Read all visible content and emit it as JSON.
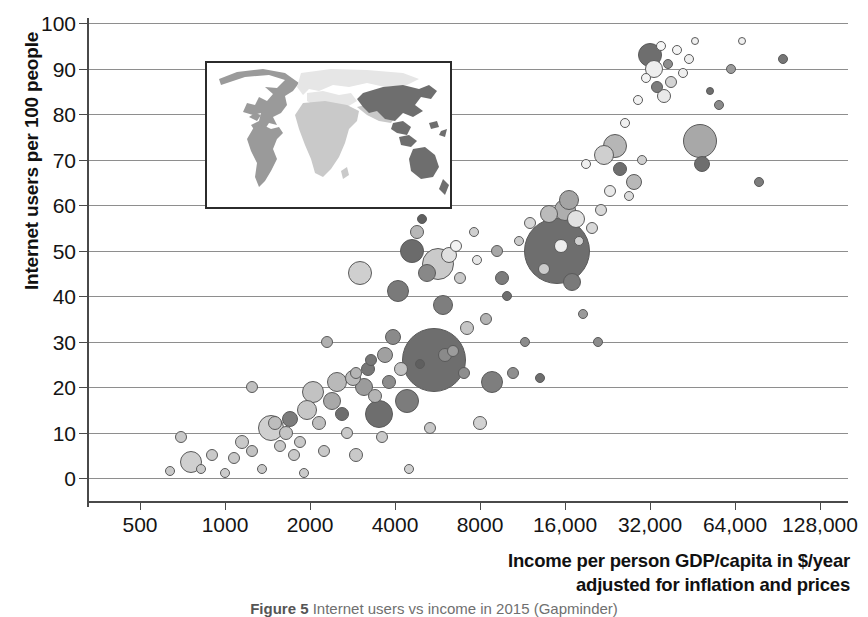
{
  "chart_data": {
    "type": "scatter",
    "xlabel": "Income per person GDP/capita in $/year adjusted for inflation and prices",
    "xlabel_lines": [
      "Income per person GDP/capita in $/year",
      "adjusted for inflation and prices"
    ],
    "ylabel": "Internet users per 100 people",
    "xscale": "log2",
    "xlim": [
      350,
      180000
    ],
    "ylim": [
      0,
      100
    ],
    "grid": true,
    "legend": "none",
    "xticks": [
      500,
      1000,
      2000,
      4000,
      8000,
      16000,
      32000,
      64000,
      128000
    ],
    "xtick_labels": [
      "500",
      "1000",
      "2000",
      "4000",
      "8000",
      "16,000",
      "32,000",
      "64,000",
      "128,000"
    ],
    "yticks": [
      0,
      10,
      20,
      30,
      40,
      50,
      60,
      70,
      80,
      90,
      100
    ],
    "ytick_labels": [
      "0",
      "10",
      "20",
      "30",
      "40",
      "50",
      "60",
      "70",
      "80",
      "90",
      "100"
    ],
    "bubble_encoding": "area = population; shade = world region",
    "region_shades": {
      "americas": "#9a9a9a",
      "europe": "#e4e4e4",
      "africa": "#c9c9c9",
      "asia": "#6e6e6e"
    },
    "points": [
      {
        "x": 640,
        "y": 1.5,
        "r": 5,
        "c": "#c9c9c9"
      },
      {
        "x": 700,
        "y": 9,
        "r": 6,
        "c": "#c9c9c9"
      },
      {
        "x": 760,
        "y": 3.5,
        "r": 11,
        "c": "#cfcfcf"
      },
      {
        "x": 820,
        "y": 2,
        "r": 5,
        "c": "#c9c9c9"
      },
      {
        "x": 900,
        "y": 5,
        "r": 6,
        "c": "#c9c9c9"
      },
      {
        "x": 1000,
        "y": 1,
        "r": 5,
        "c": "#cccccc"
      },
      {
        "x": 1080,
        "y": 4.5,
        "r": 6,
        "c": "#c9c9c9"
      },
      {
        "x": 1150,
        "y": 8,
        "r": 7,
        "c": "#c9c9c9"
      },
      {
        "x": 1250,
        "y": 6,
        "r": 6,
        "c": "#c2c2c2"
      },
      {
        "x": 1350,
        "y": 2,
        "r": 5,
        "c": "#c9c9c9"
      },
      {
        "x": 1450,
        "y": 11,
        "r": 13,
        "c": "#cfcfcf"
      },
      {
        "x": 1500,
        "y": 12,
        "r": 7,
        "c": "#bdbdbd"
      },
      {
        "x": 1560,
        "y": 7,
        "r": 6,
        "c": "#c9c9c9"
      },
      {
        "x": 1640,
        "y": 10,
        "r": 7,
        "c": "#c4c4c4"
      },
      {
        "x": 1700,
        "y": 13,
        "r": 8,
        "c": "#7c7c7c"
      },
      {
        "x": 1760,
        "y": 5,
        "r": 6,
        "c": "#c9c9c9"
      },
      {
        "x": 1850,
        "y": 8,
        "r": 6,
        "c": "#c9c9c9"
      },
      {
        "x": 1950,
        "y": 15,
        "r": 10,
        "c": "#c7c7c7"
      },
      {
        "x": 2050,
        "y": 19,
        "r": 11,
        "c": "#c2c2c2"
      },
      {
        "x": 2150,
        "y": 12,
        "r": 7,
        "c": "#bfbfbf"
      },
      {
        "x": 2250,
        "y": 6,
        "r": 6,
        "c": "#c9c9c9"
      },
      {
        "x": 2400,
        "y": 17,
        "r": 9,
        "c": "#a8a8a8"
      },
      {
        "x": 2500,
        "y": 21,
        "r": 10,
        "c": "#b9b9b9"
      },
      {
        "x": 2600,
        "y": 14,
        "r": 7,
        "c": "#6e6e6e"
      },
      {
        "x": 2700,
        "y": 10,
        "r": 6,
        "c": "#c9c9c9"
      },
      {
        "x": 2850,
        "y": 22,
        "r": 8,
        "c": "#bcbcbc"
      },
      {
        "x": 2900,
        "y": 5,
        "r": 7,
        "c": "#c9c9c9"
      },
      {
        "x": 3000,
        "y": 45,
        "r": 12,
        "c": "#cfcfcf"
      },
      {
        "x": 3100,
        "y": 20,
        "r": 9,
        "c": "#9b9b9b"
      },
      {
        "x": 3200,
        "y": 24,
        "r": 7,
        "c": "#767676"
      },
      {
        "x": 3300,
        "y": 26,
        "r": 6,
        "c": "#777777"
      },
      {
        "x": 3400,
        "y": 18,
        "r": 7,
        "c": "#b4b4b4"
      },
      {
        "x": 3500,
        "y": 14,
        "r": 14,
        "c": "#6e6e6e"
      },
      {
        "x": 3700,
        "y": 27,
        "r": 8,
        "c": "#a0a0a0"
      },
      {
        "x": 3800,
        "y": 21,
        "r": 7,
        "c": "#8d8d8d"
      },
      {
        "x": 3950,
        "y": 31,
        "r": 8,
        "c": "#8a8a8a"
      },
      {
        "x": 4100,
        "y": 41,
        "r": 11,
        "c": "#7a7a7a"
      },
      {
        "x": 4200,
        "y": 24,
        "r": 7,
        "c": "#c3c3c3"
      },
      {
        "x": 4400,
        "y": 17,
        "r": 12,
        "c": "#7c7c7c"
      },
      {
        "x": 4600,
        "y": 50,
        "r": 12,
        "c": "#6b6b6b"
      },
      {
        "x": 4800,
        "y": 54,
        "r": 7,
        "c": "#b7b7b7"
      },
      {
        "x": 5000,
        "y": 57,
        "r": 5,
        "c": "#5f5f5f"
      },
      {
        "x": 5200,
        "y": 45,
        "r": 9,
        "c": "#888888"
      },
      {
        "x": 5500,
        "y": 26,
        "r": 32,
        "c": "#6e6e6e"
      },
      {
        "x": 5700,
        "y": 47,
        "r": 16,
        "c": "#cacaca"
      },
      {
        "x": 5900,
        "y": 38,
        "r": 10,
        "c": "#7e7e7e"
      },
      {
        "x": 6200,
        "y": 49,
        "r": 8,
        "c": "#e0e0e0"
      },
      {
        "x": 6400,
        "y": 28,
        "r": 6,
        "c": "#9c9c9c"
      },
      {
        "x": 6600,
        "y": 51,
        "r": 6,
        "c": "#f2f2f2"
      },
      {
        "x": 6800,
        "y": 44,
        "r": 6,
        "c": "#cacaca"
      },
      {
        "x": 7000,
        "y": 23,
        "r": 6,
        "c": "#8e8e8e"
      },
      {
        "x": 7200,
        "y": 33,
        "r": 7,
        "c": "#c6c6c6"
      },
      {
        "x": 7600,
        "y": 54,
        "r": 5,
        "c": "#cfcfcf"
      },
      {
        "x": 8000,
        "y": 12,
        "r": 7,
        "c": "#d2d2d2"
      },
      {
        "x": 8400,
        "y": 35,
        "r": 6,
        "c": "#b3b3b3"
      },
      {
        "x": 8800,
        "y": 21,
        "r": 11,
        "c": "#7e7e7e"
      },
      {
        "x": 9200,
        "y": 50,
        "r": 6,
        "c": "#a7a7a7"
      },
      {
        "x": 9600,
        "y": 44,
        "r": 7,
        "c": "#7c7c7c"
      },
      {
        "x": 10000,
        "y": 40,
        "r": 5,
        "c": "#6e6e6e"
      },
      {
        "x": 11000,
        "y": 52,
        "r": 5,
        "c": "#cacaca"
      },
      {
        "x": 11500,
        "y": 30,
        "r": 5,
        "c": "#8b8b8b"
      },
      {
        "x": 12000,
        "y": 56,
        "r": 6,
        "c": "#d6d6d6"
      },
      {
        "x": 13000,
        "y": 22,
        "r": 5,
        "c": "#6e6e6e"
      },
      {
        "x": 14000,
        "y": 58,
        "r": 9,
        "c": "#bbbbbb"
      },
      {
        "x": 15000,
        "y": 50,
        "r": 33,
        "c": "#6e6e6e"
      },
      {
        "x": 15500,
        "y": 51,
        "r": 7,
        "c": "#ededed"
      },
      {
        "x": 16000,
        "y": 59,
        "r": 11,
        "c": "#aeaeae"
      },
      {
        "x": 16500,
        "y": 61,
        "r": 10,
        "c": "#a4a4a4"
      },
      {
        "x": 17000,
        "y": 43,
        "r": 9,
        "c": "#7a7a7a"
      },
      {
        "x": 17500,
        "y": 57,
        "r": 9,
        "c": "#e2e2e2"
      },
      {
        "x": 18000,
        "y": 52,
        "r": 5,
        "c": "#d0d0d0"
      },
      {
        "x": 18500,
        "y": 36,
        "r": 5,
        "c": "#9a9a9a"
      },
      {
        "x": 19000,
        "y": 69,
        "r": 5,
        "c": "#efefef"
      },
      {
        "x": 20000,
        "y": 55,
        "r": 6,
        "c": "#d8d8d8"
      },
      {
        "x": 21000,
        "y": 30,
        "r": 5,
        "c": "#8c8c8c"
      },
      {
        "x": 22000,
        "y": 71,
        "r": 10,
        "c": "#cfcfcf"
      },
      {
        "x": 23000,
        "y": 63,
        "r": 6,
        "c": "#e8e8e8"
      },
      {
        "x": 24000,
        "y": 73,
        "r": 12,
        "c": "#b6b6b6"
      },
      {
        "x": 25000,
        "y": 68,
        "r": 7,
        "c": "#6e6e6e"
      },
      {
        "x": 26000,
        "y": 78,
        "r": 5,
        "c": "#f0f0f0"
      },
      {
        "x": 27000,
        "y": 62,
        "r": 5,
        "c": "#dcdcdc"
      },
      {
        "x": 28000,
        "y": 65,
        "r": 8,
        "c": "#b8b8b8"
      },
      {
        "x": 29000,
        "y": 83,
        "r": 5,
        "c": "#f2f2f2"
      },
      {
        "x": 30000,
        "y": 70,
        "r": 5,
        "c": "#cfcfcf"
      },
      {
        "x": 31000,
        "y": 88,
        "r": 5,
        "c": "#f4f4f4"
      },
      {
        "x": 32000,
        "y": 93,
        "r": 12,
        "c": "#6e6e6e"
      },
      {
        "x": 33000,
        "y": 90,
        "r": 9,
        "c": "#eeeeee"
      },
      {
        "x": 34000,
        "y": 86,
        "r": 6,
        "c": "#7c7c7c"
      },
      {
        "x": 35000,
        "y": 95,
        "r": 5,
        "c": "#f6f6f6"
      },
      {
        "x": 36000,
        "y": 84,
        "r": 7,
        "c": "#e9e9e9"
      },
      {
        "x": 37000,
        "y": 91,
        "r": 5,
        "c": "#8d8d8d"
      },
      {
        "x": 38000,
        "y": 87,
        "r": 6,
        "c": "#d4d4d4"
      },
      {
        "x": 40000,
        "y": 94,
        "r": 5,
        "c": "#f4f4f4"
      },
      {
        "x": 42000,
        "y": 89,
        "r": 5,
        "c": "#efefef"
      },
      {
        "x": 44000,
        "y": 92,
        "r": 5,
        "c": "#eeeeee"
      },
      {
        "x": 46000,
        "y": 96,
        "r": 4,
        "c": "#f0f0f0"
      },
      {
        "x": 48000,
        "y": 74,
        "r": 17,
        "c": "#a8a8a8"
      },
      {
        "x": 49000,
        "y": 69,
        "r": 8,
        "c": "#6e6e6e"
      },
      {
        "x": 52000,
        "y": 85,
        "r": 4,
        "c": "#6e6e6e"
      },
      {
        "x": 56000,
        "y": 82,
        "r": 5,
        "c": "#8a8a8a"
      },
      {
        "x": 62000,
        "y": 90,
        "r": 5,
        "c": "#9b9b9b"
      },
      {
        "x": 68000,
        "y": 96,
        "r": 4,
        "c": "#f0f0f0"
      },
      {
        "x": 78000,
        "y": 65,
        "r": 5,
        "c": "#7c7c7c"
      },
      {
        "x": 95000,
        "y": 92,
        "r": 5,
        "c": "#767676"
      },
      {
        "x": 1250,
        "y": 20,
        "r": 6,
        "c": "#c0c0c0"
      },
      {
        "x": 2900,
        "y": 23,
        "r": 6,
        "c": "#b5b5b5"
      },
      {
        "x": 4900,
        "y": 25,
        "r": 5,
        "c": "#5f5f5f"
      },
      {
        "x": 6000,
        "y": 27,
        "r": 7,
        "c": "#8a8a8a"
      },
      {
        "x": 7800,
        "y": 48,
        "r": 5,
        "c": "#e6e6e6"
      },
      {
        "x": 10500,
        "y": 23,
        "r": 6,
        "c": "#8f8f8f"
      },
      {
        "x": 13500,
        "y": 46,
        "r": 6,
        "c": "#cbcbcb"
      },
      {
        "x": 21500,
        "y": 59,
        "r": 6,
        "c": "#d9d9d9"
      },
      {
        "x": 2300,
        "y": 30,
        "r": 6,
        "c": "#b0b0b0"
      },
      {
        "x": 3600,
        "y": 9,
        "r": 6,
        "c": "#cacaca"
      },
      {
        "x": 5300,
        "y": 11,
        "r": 6,
        "c": "#c8c8c8"
      },
      {
        "x": 4500,
        "y": 2,
        "r": 5,
        "c": "#cfcfcf"
      },
      {
        "x": 1900,
        "y": 1,
        "r": 5,
        "c": "#cbcbcb"
      }
    ]
  },
  "inset_map": {
    "name": "world-region-map",
    "regions": [
      {
        "name": "americas",
        "shade": "#9a9a9a"
      },
      {
        "name": "europe",
        "shade": "#e6e6e6"
      },
      {
        "name": "africa",
        "shade": "#c9c9c9"
      },
      {
        "name": "asia",
        "shade": "#6e6e6e"
      }
    ]
  },
  "caption": {
    "figure_number": "Figure 5",
    "text": "Internet users vs income in 2015 (Gapminder)"
  }
}
